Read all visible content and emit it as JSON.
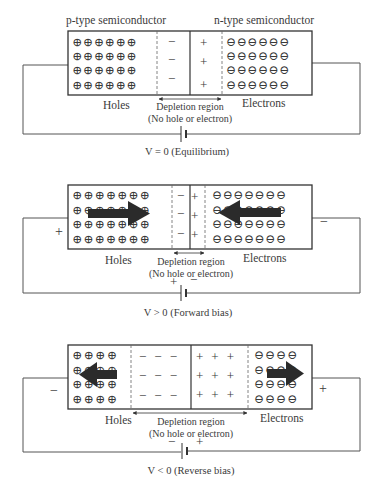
{
  "diagram": {
    "panels": [
      {
        "id": "equilibrium",
        "top_labels": {
          "left": "p-type semiconductor",
          "right": "n-type semiconductor"
        },
        "left_label": "Holes",
        "right_label": "Electrons",
        "depletion_label": "Depletion region",
        "depletion_sublabel": "(No hole or electron)",
        "caption": "V = 0 (Equilibrium)",
        "hole_cols": 6,
        "electron_cols": 6,
        "depletion_cols_each_side": 1,
        "left_terminal": "",
        "right_terminal": "",
        "battery_left_sign": "",
        "battery_right_sign": "",
        "arrows": "none"
      },
      {
        "id": "forward",
        "left_label": "Holes",
        "right_label": "Electrons",
        "depletion_label": "Depletion region",
        "depletion_sublabel": "(No hole or electron)",
        "caption": "V > 0 (Forward bias)",
        "hole_cols": 7,
        "electron_cols": 7,
        "depletion_cols_each_side": 1,
        "left_terminal": "+",
        "right_terminal": "−",
        "battery_left_sign": "+",
        "battery_right_sign": "−",
        "arrows": "toward junction"
      },
      {
        "id": "reverse",
        "left_label": "Holes",
        "right_label": "Electrons",
        "depletion_label": "Depletion region",
        "depletion_sublabel": "(No hole or electron)",
        "caption": "V < 0 (Reverse bias)",
        "hole_cols": 4,
        "electron_cols": 4,
        "depletion_cols_each_side": 3,
        "left_terminal": "−",
        "right_terminal": "+",
        "battery_left_sign": "−",
        "battery_right_sign": "+",
        "arrows": "away from junction"
      }
    ],
    "symbols": {
      "hole": "⊕",
      "electron": "⊖",
      "minus": "−",
      "plus": "+"
    },
    "colors": {
      "line": "#333333",
      "arrow": "#2b2b2b",
      "text": "#3a3a3a"
    }
  }
}
